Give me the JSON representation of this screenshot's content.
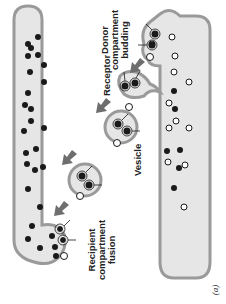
{
  "figure": {
    "panel_label": "(a)",
    "colors": {
      "compartment_fill": "#e6e6e6",
      "compartment_stroke": "#9a9a9a",
      "cargo_dark": "#1a1a1a",
      "cargo_open": "#ffffff",
      "arrow": "#6e6e6e"
    },
    "labels": {
      "donor_line1": "Donor",
      "donor_line2": "compartment",
      "donor_line3": "budding",
      "receptor": "Receptor",
      "vesicle": "Vesicle",
      "recipient_line1": "Recipient",
      "recipient_line2": "compartment",
      "recipient_line3": "fusion"
    }
  }
}
